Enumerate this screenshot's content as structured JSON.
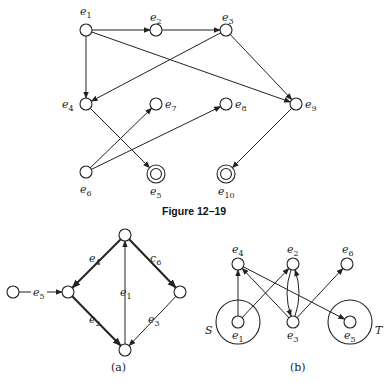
{
  "figure_top": {
    "caption": "Figure 12–19",
    "nodes": [
      {
        "id": "e1",
        "base": "e",
        "sub": "1",
        "x": 86,
        "y": 30,
        "double": false,
        "lx": 80,
        "ly": 15
      },
      {
        "id": "e2",
        "base": "e",
        "sub": "2",
        "x": 156,
        "y": 30,
        "double": false,
        "lx": 150,
        "ly": 21
      },
      {
        "id": "e3",
        "base": "e",
        "sub": "3",
        "x": 226,
        "y": 30,
        "double": false,
        "lx": 222,
        "ly": 21
      },
      {
        "id": "e4",
        "base": "e",
        "sub": "4",
        "x": 86,
        "y": 104,
        "double": false,
        "lx": 62,
        "ly": 108
      },
      {
        "id": "e7",
        "base": "e",
        "sub": "7",
        "x": 156,
        "y": 104,
        "double": false,
        "lx": 165,
        "ly": 108
      },
      {
        "id": "e8",
        "base": "e",
        "sub": "8",
        "x": 226,
        "y": 104,
        "double": false,
        "lx": 235,
        "ly": 108
      },
      {
        "id": "e9",
        "base": "e",
        "sub": "9",
        "x": 296,
        "y": 104,
        "double": false,
        "lx": 305,
        "ly": 108
      },
      {
        "id": "e6",
        "base": "e",
        "sub": "6",
        "x": 86,
        "y": 172,
        "double": false,
        "lx": 80,
        "ly": 193
      },
      {
        "id": "e5",
        "base": "e",
        "sub": "5",
        "x": 156,
        "y": 174,
        "double": true,
        "lx": 150,
        "ly": 195
      },
      {
        "id": "e10",
        "base": "e",
        "sub": "10",
        "x": 226,
        "y": 174,
        "double": true,
        "lx": 218,
        "ly": 195
      }
    ],
    "edges": [
      {
        "from": "e1",
        "to": "e2"
      },
      {
        "from": "e2",
        "to": "e3"
      },
      {
        "from": "e1",
        "to": "e4"
      },
      {
        "from": "e1",
        "to": "e9"
      },
      {
        "from": "e3",
        "to": "e4"
      },
      {
        "from": "e3",
        "to": "e9"
      },
      {
        "from": "e4",
        "to": "e5"
      },
      {
        "from": "e6",
        "to": "e7"
      },
      {
        "from": "e6",
        "to": "e8"
      },
      {
        "from": "e9",
        "to": "e10"
      }
    ]
  },
  "figure_a": {
    "label": "(a)",
    "nodes": [
      {
        "id": "L",
        "x": 13,
        "y": 292
      },
      {
        "id": "M",
        "x": 68,
        "y": 292
      },
      {
        "id": "T",
        "x": 125,
        "y": 235
      },
      {
        "id": "R",
        "x": 180,
        "y": 292
      },
      {
        "id": "B",
        "x": 125,
        "y": 350
      }
    ],
    "edges": [
      {
        "from": "L",
        "to": "M",
        "base": "e",
        "sub": "5",
        "bold": false,
        "lx": 33,
        "ly": 296
      },
      {
        "from": "T",
        "to": "M",
        "base": "e",
        "sub": "4",
        "bold": true,
        "lx": 89,
        "ly": 262
      },
      {
        "from": "T",
        "to": "R",
        "base": "c",
        "sub": "6",
        "bold": true,
        "lx": 150,
        "ly": 262
      },
      {
        "from": "M",
        "to": "B",
        "base": "e",
        "sub": "2",
        "bold": true,
        "lx": 89,
        "ly": 323
      },
      {
        "from": "R",
        "to": "B",
        "base": "e",
        "sub": "3",
        "bold": false,
        "lx": 148,
        "ly": 323
      },
      {
        "from": "B",
        "to": "T",
        "base": "e",
        "sub": "1",
        "bold": false,
        "lx": 120,
        "ly": 296
      }
    ]
  },
  "figure_b": {
    "label": "(b)",
    "set_labels": [
      {
        "text": "S",
        "x": 205,
        "y": 334
      },
      {
        "text": "T",
        "x": 375,
        "y": 334
      }
    ],
    "nodes": [
      {
        "id": "e4",
        "base": "e",
        "sub": "4",
        "x": 238,
        "y": 264,
        "lx": 232,
        "ly": 253
      },
      {
        "id": "e2",
        "base": "e",
        "sub": "2",
        "x": 293,
        "y": 264,
        "lx": 287,
        "ly": 253
      },
      {
        "id": "e6",
        "base": "e",
        "sub": "6",
        "x": 347,
        "y": 264,
        "lx": 342,
        "ly": 253
      },
      {
        "id": "e1",
        "base": "e",
        "sub": "1",
        "x": 238,
        "y": 322,
        "lx": 232,
        "ly": 339
      },
      {
        "id": "e3",
        "base": "e",
        "sub": "3",
        "x": 293,
        "y": 322,
        "lx": 287,
        "ly": 339
      },
      {
        "id": "e5",
        "base": "e",
        "sub": "5",
        "x": 350,
        "y": 322,
        "lx": 344,
        "ly": 339
      }
    ],
    "set_circles": [
      {
        "around": "e1",
        "r": 22
      },
      {
        "around": "e5",
        "r": 22
      }
    ],
    "edges": [
      {
        "from": "e1",
        "to": "e4"
      },
      {
        "from": "e1",
        "to": "e2"
      },
      {
        "from": "e3",
        "to": "e4"
      },
      {
        "from": "e4",
        "to": "e5"
      },
      {
        "from": "e3",
        "to": "e6"
      },
      {
        "from": "e3",
        "to": "e2",
        "curve": 8
      },
      {
        "from": "e2",
        "to": "e3",
        "curve": 8
      }
    ]
  }
}
